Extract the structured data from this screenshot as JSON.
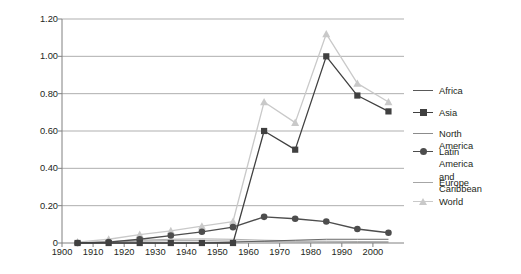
{
  "chart_data": {
    "type": "line",
    "title": "",
    "xlabel": "",
    "ylabel": "Annual under-5 deaths avoided, millions",
    "xlim": [
      1900,
      2010
    ],
    "ylim": [
      0,
      1.2
    ],
    "ytick_labels": [
      "1.20",
      "1.00",
      "0.80",
      "0.60",
      "0.40",
      "0.20",
      "0"
    ],
    "ytick_values": [
      1.2,
      1.0,
      0.8,
      0.6,
      0.4,
      0.2,
      0
    ],
    "xtick_labels": [
      "1900",
      "1910",
      "1920",
      "1930",
      "1940",
      "1950",
      "1960",
      "1970",
      "1980",
      "1990",
      "2000"
    ],
    "xtick_values": [
      1900,
      1910,
      1920,
      1930,
      1940,
      1950,
      1960,
      1970,
      1980,
      1990,
      2000
    ],
    "x": [
      1905,
      1915,
      1925,
      1935,
      1945,
      1955,
      1965,
      1975,
      1985,
      1995,
      2005
    ],
    "grid": "horizontal",
    "legend_position": "right",
    "series": [
      {
        "name": "Africa",
        "marker": "none",
        "color": "#595959",
        "values": [
          0.0,
          0.0,
          0.0,
          0.0,
          0.0,
          0.005,
          0.01,
          0.015,
          0.02,
          0.02,
          0.02
        ]
      },
      {
        "name": "Asia",
        "marker": "square",
        "color": "#404040",
        "values": [
          0.0,
          0.0,
          0.0,
          0.0,
          0.0,
          0.0,
          0.6,
          0.5,
          1.0,
          0.79,
          0.705
        ]
      },
      {
        "name": "North America",
        "marker": "none",
        "color": "#8c8c8c",
        "values": [
          0.0,
          0.005,
          0.01,
          0.012,
          0.012,
          0.01,
          0.008,
          0.006,
          0.005,
          0.004,
          0.004
        ]
      },
      {
        "name": "Latin America\nand Caribbean",
        "marker": "circle",
        "color": "#4d4d4d",
        "values": [
          0.0,
          0.005,
          0.02,
          0.04,
          0.06,
          0.085,
          0.14,
          0.13,
          0.115,
          0.075,
          0.055
        ]
      },
      {
        "name": "Europe",
        "marker": "none",
        "color": "#a6a6a6",
        "values": [
          0.0,
          0.008,
          0.015,
          0.02,
          0.022,
          0.02,
          0.015,
          0.012,
          0.01,
          0.008,
          0.007
        ]
      },
      {
        "name": "World",
        "marker": "triangle",
        "color": "#c9c9c9",
        "values": [
          0.005,
          0.02,
          0.045,
          0.065,
          0.09,
          0.115,
          0.755,
          0.645,
          1.12,
          0.855,
          0.755
        ]
      }
    ]
  },
  "axis_colors": {
    "axis_line": "#808080",
    "gridline": "#a6a6a6",
    "text": "#231f20"
  }
}
